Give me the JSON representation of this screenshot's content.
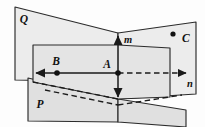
{
  "figure": {
    "background_color": "#fdfdfd",
    "stroke_color": "#1a1a1a",
    "canvas": {
      "width": 205,
      "height": 127
    }
  },
  "planes": [
    {
      "id": "plane-q",
      "label": "Q",
      "label_x": 24,
      "label_y": 20,
      "fill": "#ececec",
      "outline": "#2b2b2b",
      "points": "15,7 118,33 118,82 15,80",
      "description": "upper-left slanted plane"
    },
    {
      "id": "plane-right-wing",
      "label": "",
      "label_x": 0,
      "label_y": 0,
      "fill": "#ececec",
      "outline": "#2b2b2b",
      "points": "118,33 196,22 196,94 118,99",
      "description": "upper-right wing of plane Q"
    },
    {
      "id": "plane-p",
      "label": "P",
      "label_x": 40,
      "label_y": 105,
      "fill": "#e0e0e0",
      "outline": "#2b2b2b",
      "points": "28,78 118,99 118,122 28,121",
      "description": "lower-left slanted plane P"
    },
    {
      "id": "plane-p-right",
      "label": "",
      "label_x": 0,
      "label_y": 0,
      "fill": "#e0e0e0",
      "outline": "#2b2b2b",
      "points": "118,99 186,110 186,127 118,122",
      "description": "lower-right wing of plane P"
    },
    {
      "id": "plane-middle",
      "label": "",
      "label_x": 0,
      "label_y": 0,
      "fill": "#e4e4e4",
      "outline": "#2b2b2b",
      "points": "33,45 118,45 170,48 170,97 118,99 33,82",
      "description": "central front plane"
    }
  ],
  "lines": [
    {
      "id": "line-m",
      "label": "m",
      "label_x": 124,
      "label_y": 41,
      "style": "solid",
      "arrow_start": true,
      "arrow_end": true,
      "path": "M118,36 L118,97",
      "description": "vertical line m through point A"
    },
    {
      "id": "line-n-left",
      "label": "",
      "label_x": 0,
      "label_y": 0,
      "style": "solid",
      "arrow_start": true,
      "arrow_end": false,
      "path": "M36,73 L118,73",
      "description": "solid left half of line n ending in arrow"
    },
    {
      "id": "line-n-right",
      "label": "n",
      "label_x": 190,
      "label_y": 85,
      "style": "dashed",
      "arrow_start": false,
      "arrow_end": true,
      "path": "M118,73 L186,73",
      "description": "dashed right half of line n ending in arrow"
    },
    {
      "id": "line-p-diagonal-upper",
      "label": "",
      "label_x": 0,
      "label_y": 0,
      "style": "dashed",
      "arrow_start": false,
      "arrow_end": false,
      "path": "M33,82 L118,99",
      "description": "hidden diagonal edge in plane P"
    },
    {
      "id": "line-p-diagonal-lower",
      "label": "",
      "label_x": 0,
      "label_y": 0,
      "style": "dashed",
      "arrow_start": false,
      "arrow_end": false,
      "path": "M45,90 L118,105",
      "description": "hidden lower diagonal edge in plane P"
    },
    {
      "id": "line-p-diagonal-right",
      "label": "",
      "label_x": 0,
      "label_y": 0,
      "style": "dashed",
      "arrow_start": false,
      "arrow_end": false,
      "path": "M118,105 L182,95",
      "description": "hidden diagonal edge on right of plane P"
    }
  ],
  "points": [
    {
      "id": "point-a",
      "label": "A",
      "x": 118,
      "y": 73,
      "label_x": 107,
      "label_y": 65,
      "radius": 2.8
    },
    {
      "id": "point-b",
      "label": "B",
      "x": 57,
      "y": 73,
      "label_x": 56,
      "label_y": 62,
      "radius": 2.8
    },
    {
      "id": "point-c",
      "label": "C",
      "x": 173,
      "y": 34,
      "label_x": 182,
      "label_y": 39,
      "radius": 2.6
    }
  ]
}
